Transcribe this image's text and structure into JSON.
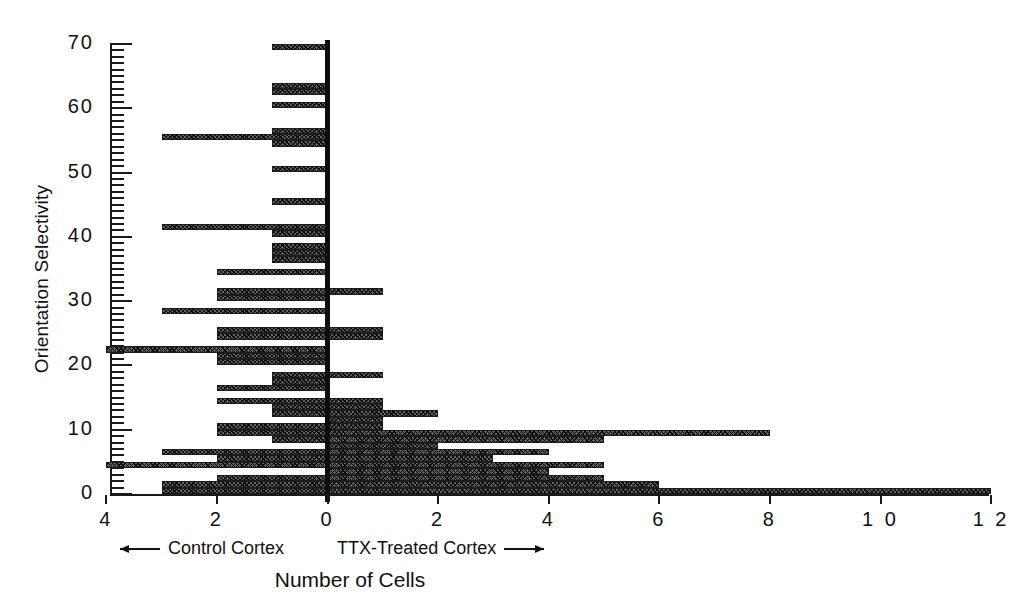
{
  "chart_data": {
    "type": "bar",
    "orientation": "horizontal-diverging",
    "title": "",
    "xlabel": "Number of Cells",
    "ylabel": "Orientation Selectivity",
    "grid": false,
    "legend_position": "below-axis",
    "x_tick_labels": [
      "4",
      "2",
      "0",
      "2",
      "4",
      "6",
      "8",
      "1 0",
      "1 2"
    ],
    "x_tick_values": [
      -4,
      -2,
      0,
      2,
      4,
      6,
      8,
      10,
      12
    ],
    "xlim": [
      -4,
      12
    ],
    "y_tick_labels": [
      "0",
      "10",
      "20",
      "30",
      "40",
      "50",
      "60",
      "70"
    ],
    "y_tick_values": [
      0,
      10,
      20,
      30,
      40,
      50,
      60,
      70
    ],
    "ylim": [
      0,
      70
    ],
    "y_minor_tick_step": 1,
    "bin_width": 1,
    "series": [
      {
        "name": "Control Cortex",
        "direction": "left",
        "color": "#5f5f5f",
        "bins": [
          0,
          1,
          2,
          3,
          4,
          5,
          6,
          7,
          8,
          9,
          10,
          11,
          12,
          13,
          14,
          15,
          16,
          17,
          18,
          19,
          20,
          21,
          22,
          23,
          24,
          25,
          26,
          27,
          28,
          29,
          30,
          31,
          32,
          33,
          34,
          35,
          36,
          37,
          38,
          39,
          40,
          41,
          42,
          43,
          44,
          45,
          46,
          47,
          48,
          49,
          50,
          51,
          52,
          53,
          54,
          55,
          56,
          57,
          58,
          59,
          60,
          61,
          62,
          63,
          64,
          65,
          66,
          67,
          68,
          69
        ],
        "values": [
          3,
          3,
          2,
          0,
          4,
          2,
          3,
          0,
          1,
          2,
          2,
          0,
          1,
          1,
          2,
          0,
          2,
          1,
          1,
          0,
          2,
          2,
          4,
          0,
          2,
          2,
          0,
          0,
          3,
          0,
          2,
          2,
          0,
          0,
          2,
          0,
          1,
          1,
          1,
          0,
          1,
          3,
          0,
          0,
          0,
          1,
          0,
          0,
          0,
          0,
          1,
          0,
          0,
          0,
          1,
          3,
          1,
          0,
          0,
          0,
          1,
          0,
          1,
          1,
          0,
          0,
          0,
          0,
          0,
          1
        ]
      },
      {
        "name": "TTX-Treated Cortex",
        "direction": "right",
        "color": "#5f5f5f",
        "bins": [
          0,
          1,
          2,
          3,
          4,
          5,
          6,
          7,
          8,
          9,
          10,
          11,
          12,
          13,
          14,
          15,
          16,
          17,
          18,
          19,
          20,
          21,
          22,
          23,
          24,
          25,
          26,
          27,
          28,
          29,
          30,
          31,
          32,
          33,
          34,
          35,
          36,
          37,
          38,
          39,
          40,
          41,
          42,
          43,
          44,
          45,
          46,
          47,
          48,
          49,
          50,
          51,
          52,
          53,
          54,
          55,
          56,
          57,
          58,
          59,
          60,
          61,
          62,
          63,
          64,
          65,
          66,
          67,
          68,
          69
        ],
        "values": [
          12,
          6,
          5,
          4,
          5,
          3,
          4,
          2,
          5,
          8,
          1,
          1,
          2,
          1,
          1,
          0,
          0,
          0,
          1,
          0,
          0,
          0,
          0,
          0,
          1,
          1,
          0,
          0,
          0,
          0,
          0,
          1,
          0,
          0,
          0,
          0,
          0,
          0,
          0,
          0,
          0,
          0,
          0,
          0,
          0,
          0,
          0,
          0,
          0,
          0,
          0,
          0,
          0,
          0,
          0,
          0,
          0,
          0,
          0,
          0,
          0,
          0,
          0,
          0,
          0,
          0,
          0,
          0,
          0,
          0
        ]
      }
    ]
  },
  "axes": {
    "y_title": "Orientation Selectivity",
    "x_title": "Number of Cells",
    "y_ticks": [
      {
        "label": "70",
        "value": 70
      },
      {
        "label": "60",
        "value": 60
      },
      {
        "label": "50",
        "value": 50
      },
      {
        "label": "40",
        "value": 40
      },
      {
        "label": "30",
        "value": 30
      },
      {
        "label": "20",
        "value": 20
      },
      {
        "label": "10",
        "value": 10
      },
      {
        "label": "0",
        "value": 0
      }
    ],
    "x_ticks": [
      {
        "label": "4",
        "value": -4
      },
      {
        "label": "2",
        "value": -2
      },
      {
        "label": "0",
        "value": 0
      },
      {
        "label": "2",
        "value": 2
      },
      {
        "label": "4",
        "value": 4
      },
      {
        "label": "6",
        "value": 6
      },
      {
        "label": "8",
        "value": 8
      },
      {
        "label": "1 0",
        "value": 10
      },
      {
        "label": "1 2",
        "value": 12
      }
    ]
  },
  "direction_legend": {
    "left_label": "Control Cortex",
    "left_arrow": "left-arrow-icon",
    "right_label": "TTX-Treated Cortex",
    "right_arrow": "right-arrow-icon"
  },
  "style": {
    "bar_fill": "#5f5f5f",
    "bar_edge": "#1c1c1c",
    "axis_color": "#1a1a1a",
    "zero_line_color": "#0d0d0d",
    "background": "#ffffff"
  }
}
